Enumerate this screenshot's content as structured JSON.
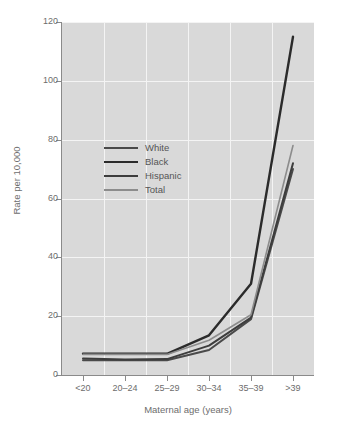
{
  "chart_data": {
    "type": "line",
    "title": "",
    "xlabel": "Maternal age (years)",
    "ylabel": "Rate per 10,000",
    "categories": [
      "<20",
      "20–24",
      "25–29",
      "30–34",
      "35–39",
      ">39"
    ],
    "xtick_labels": [
      "<20",
      "20–24",
      "25–29",
      "30–34",
      "35–39",
      ">39"
    ],
    "ytick_labels": [
      "0",
      "20",
      "40",
      "60",
      "80",
      "100",
      "120"
    ],
    "yticks": [
      0,
      20,
      40,
      60,
      80,
      100,
      120
    ],
    "ylim": [
      0,
      120
    ],
    "grid": true,
    "legend_position": "inside-upper-left",
    "series": [
      {
        "name": "White",
        "color": "#4a4a4a",
        "width": 2.0,
        "values": [
          5.0,
          5.0,
          5.0,
          8.5,
          19.0,
          70.0
        ]
      },
      {
        "name": "Black",
        "color": "#2b2b2b",
        "width": 2.4,
        "values": [
          7.2,
          7.2,
          7.2,
          13.5,
          31.0,
          115.0
        ]
      },
      {
        "name": "Hispanic",
        "color": "#3d3d3d",
        "width": 2.0,
        "values": [
          5.6,
          5.3,
          5.4,
          10.0,
          19.5,
          72.0
        ]
      },
      {
        "name": "Total",
        "color": "#8c8c8c",
        "width": 1.6,
        "values": [
          7.0,
          7.0,
          7.0,
          11.8,
          20.5,
          78.0
        ]
      }
    ]
  },
  "legend": {
    "items": [
      {
        "label": "White"
      },
      {
        "label": "Black"
      },
      {
        "label": "Hispanic"
      },
      {
        "label": "Total"
      }
    ]
  },
  "colors": {
    "plot_background": "#d9d9d9",
    "gridline": "#f4f4f4",
    "axis": "#8a8a8a",
    "tick_text": "#6d6d6d",
    "page_background": "#ffffff"
  }
}
